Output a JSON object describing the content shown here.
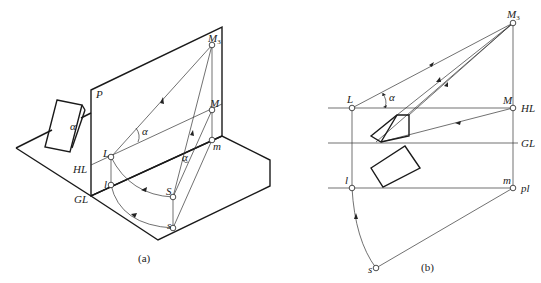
{
  "figure_a": {
    "caption": "(a)",
    "labels": {
      "plane": "P",
      "M3": "M",
      "M3_sub": "3",
      "M": "M",
      "m": "m",
      "L": "L",
      "l": "l",
      "S": "S",
      "s": "s",
      "HL": "HL",
      "GL": "GL",
      "alpha_picture": "α",
      "alpha_block": "α",
      "alpha_station": "α"
    }
  },
  "figure_b": {
    "caption": "(b)",
    "labels": {
      "M3": "M",
      "M3_sub": "3",
      "L": "L",
      "M": "M",
      "HL": "HL",
      "GL": "GL",
      "l": "l",
      "m": "m",
      "pl": "pl",
      "s": "s",
      "alpha": "α"
    }
  }
}
